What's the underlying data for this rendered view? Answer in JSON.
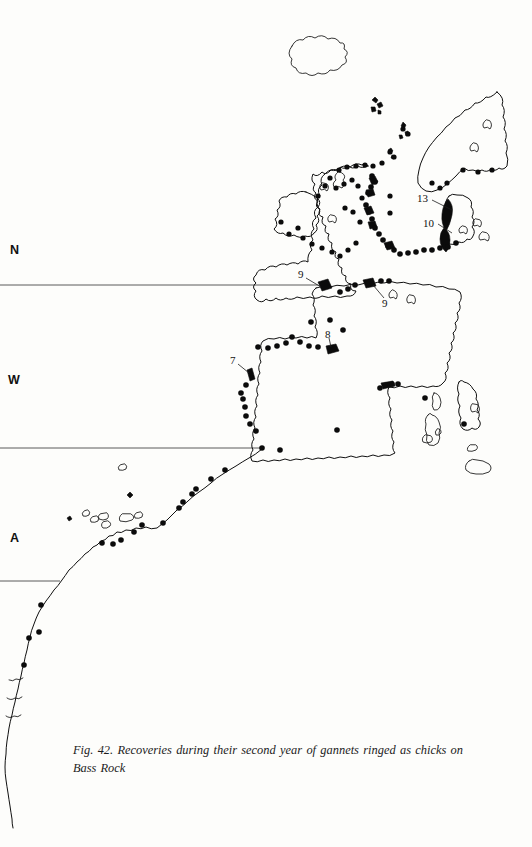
{
  "figure": {
    "caption": "Fig. 42. Recoveries during their second year of gannets ringed as chicks on Bass Rock",
    "caption_label": "Fig. 42.",
    "background_color": "#fdfdfb",
    "ink_color": "#101010"
  },
  "axis_labels": [
    {
      "name": "north-label",
      "text": "N",
      "x": 10,
      "y": 243
    },
    {
      "name": "west-label",
      "text": "W",
      "x": 9,
      "y": 373
    },
    {
      "name": "atlantic-label",
      "text": "A",
      "x": 10,
      "y": 531
    }
  ],
  "graticule_lines": [
    {
      "name": "latitude-line-upper",
      "x1": 0,
      "y1": 285,
      "x2": 318,
      "y2": 285
    },
    {
      "name": "latitude-line-middle",
      "x1": 0,
      "y1": 448,
      "x2": 262,
      "y2": 448
    },
    {
      "name": "latitude-line-lower",
      "x1": 0,
      "y1": 581,
      "x2": 60,
      "y2": 581
    }
  ],
  "recovery_counts": [
    {
      "label": "13",
      "label_x": 419,
      "label_y": 198,
      "leader_to_x": 452,
      "leader_to_y": 213,
      "region": "denmark-north-jutland"
    },
    {
      "label": "10",
      "label_x": 425,
      "label_y": 222,
      "leader_to_x": 452,
      "leader_to_y": 235,
      "region": "denmark-west-jutland"
    },
    {
      "label": "9",
      "label_x": 299,
      "label_y": 275,
      "leader_to_x": 322,
      "leader_to_y": 288,
      "region": "english-channel-west"
    },
    {
      "label": "9",
      "label_x": 385,
      "label_y": 303,
      "leader_to_x": 372,
      "leader_to_y": 285,
      "region": "belgium-netherlands-coast"
    },
    {
      "label": "8",
      "label_x": 327,
      "label_y": 335,
      "leader_to_x": 330,
      "leader_to_y": 348,
      "region": "france-biscay-coast"
    },
    {
      "label": "7",
      "label_x": 232,
      "label_y": 362,
      "leader_to_x": 249,
      "leader_to_y": 375,
      "region": "galicia-northwest-iberia"
    }
  ],
  "map": {
    "projection_note": "North Atlantic / Western Europe / NW Africa outline",
    "landmasses": [
      "iceland",
      "faroe-islands",
      "shetland-islands",
      "orkney-islands",
      "great-britain",
      "ireland",
      "norway",
      "sweden",
      "denmark",
      "france-iberia-continental",
      "italy",
      "corsica",
      "sardinia",
      "sicily",
      "balearic-islands",
      "madeira",
      "canary-islands",
      "northwest-africa"
    ],
    "symbols": {
      "recovery_dot": "filled-circle",
      "recovery_cluster": "filled-blob"
    }
  }
}
